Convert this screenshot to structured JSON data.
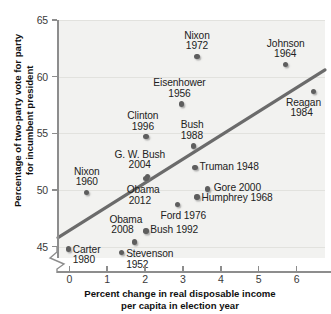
{
  "chart_data": {
    "type": "scatter",
    "title": "",
    "xlabel": "Percent change in real disposable income per capita in election year",
    "ylabel": "Percentage of two-party vote for party for incumbent president",
    "xlabel_lines": [
      "Percent change in real disposable income",
      "per capita in election year"
    ],
    "ylabel_lines": [
      "Percentage of two-party vote for party",
      "for incumbent president"
    ],
    "xlim": [
      -0.3,
      6.75
    ],
    "ylim": [
      44.0,
      65.0
    ],
    "xticks": [
      0,
      1,
      2,
      3,
      4,
      5,
      6
    ],
    "xtick_labels": [
      "0",
      "1",
      "2",
      "3",
      "4",
      "5",
      "6"
    ],
    "yticks": [
      45,
      50,
      55,
      60,
      65
    ],
    "ytick_labels": [
      "45",
      "50",
      "55",
      "60",
      "65"
    ],
    "grid": "horizontal",
    "y_axis_break": true,
    "legend": "none",
    "point_color": "#5e5e5e",
    "trend_color": "#6b6b6b",
    "panel_color": "#f2f2f0",
    "trendline": {
      "label": "least-squares fit",
      "x": [
        -0.3,
        6.75
      ],
      "y": [
        45.8,
        60.6
      ]
    },
    "points": [
      {
        "label_lines": [
          "Nixon",
          "1972"
        ],
        "name": "Nixon 1972",
        "x": 3.37,
        "y": 61.8,
        "label_pos": "above"
      },
      {
        "label_lines": [
          "Johnson",
          "1964"
        ],
        "name": "Johnson 1964",
        "x": 5.7,
        "y": 61.1,
        "label_pos": "above"
      },
      {
        "label_lines": [
          "Eisenhower",
          "1956"
        ],
        "name": "Eisenhower 1956",
        "x": 2.96,
        "y": 57.6,
        "label_pos": "above"
      },
      {
        "label_lines": [
          "Reagan",
          "1984"
        ],
        "name": "Reagan 1984",
        "x": 6.45,
        "y": 58.7,
        "label_pos": "below"
      },
      {
        "label_lines": [
          "Clinton",
          "1996"
        ],
        "name": "Clinton 1996",
        "x": 2.02,
        "y": 54.7,
        "label_pos": "above"
      },
      {
        "label_lines": [
          "Bush",
          "1988"
        ],
        "name": "Bush 1988",
        "x": 3.27,
        "y": 53.9,
        "label_pos": "above"
      },
      {
        "label_lines": [
          "G. W. Bush",
          "2004"
        ],
        "name": "G. W. Bush 2004",
        "x": 2.07,
        "y": 51.2,
        "label_pos": "above"
      },
      {
        "label_lines": [
          "Truman 1948"
        ],
        "name": "Truman 1948",
        "x": 3.32,
        "y": 52.0,
        "label_pos": "right"
      },
      {
        "label_lines": [
          "Nixon",
          "1960"
        ],
        "name": "Nixon 1960",
        "x": 0.46,
        "y": 49.8,
        "label_pos": "above"
      },
      {
        "label_lines": [
          "Obama",
          "2012"
        ],
        "name": "Obama 2012",
        "x": 2.02,
        "y": 51.0,
        "label_pos": "below"
      },
      {
        "label_lines": [
          "Gore 2000"
        ],
        "name": "Gore 2000",
        "x": 3.64,
        "y": 50.1,
        "label_pos": "right"
      },
      {
        "label_lines": [
          "Humphrey 1968"
        ],
        "name": "Humphrey 1968",
        "x": 3.37,
        "y": 49.4,
        "label_pos": "right"
      },
      {
        "label_lines": [
          "Ford 1976"
        ],
        "name": "Ford 1976",
        "x": 2.85,
        "y": 48.7,
        "label_pos": "below"
      },
      {
        "label_lines": [
          "Bush 1992"
        ],
        "name": "Bush 1992",
        "x": 2.02,
        "y": 46.4,
        "label_pos": "right"
      },
      {
        "label_lines": [
          "Obama",
          "2008"
        ],
        "name": "Obama 2008",
        "x": 1.72,
        "y": 45.4,
        "label_pos": "above"
      },
      {
        "label_lines": [
          "Carter",
          "1980"
        ],
        "name": "Carter 1980",
        "x": -0.03,
        "y": 44.8,
        "label_pos": "right"
      },
      {
        "label_lines": [
          "Stevenson",
          "1952"
        ],
        "name": "Stevenson 1952",
        "x": 1.38,
        "y": 44.5,
        "label_pos": "right"
      }
    ]
  }
}
